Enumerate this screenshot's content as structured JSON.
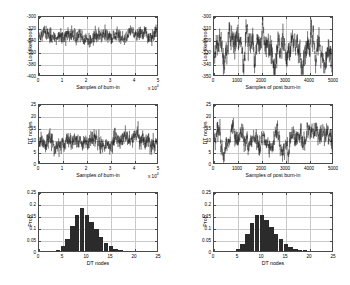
{
  "figure": {
    "background": "#ffffff",
    "axis_color": "#4a4a4a",
    "grid_color": "#c9c9c9",
    "trace_color": "#1a1a1a",
    "bar_color": "#2b2b2b"
  },
  "chart_data": [
    {
      "id": "burnin-loglik",
      "type": "line",
      "title": "",
      "xlabel": "Samples of burn-in",
      "ylabel": "Log likelihood",
      "xlim": [
        0,
        50000
      ],
      "ylim": [
        -400,
        -300
      ],
      "xticks": [
        0,
        10000,
        20000,
        30000,
        40000,
        50000
      ],
      "xticklabels": [
        "0",
        "1",
        "2",
        "3",
        "4",
        "5"
      ],
      "x_exponent": "x 10",
      "x_exponent_sup": "4",
      "yticks": [
        -400,
        -380,
        -360,
        -340,
        -320,
        -300
      ],
      "yticklabels": [
        "-400",
        "-380",
        "-360",
        "-340",
        "-320",
        "-300"
      ],
      "grid": true,
      "series_mean": -332,
      "series_spread": 9,
      "n_points": 900,
      "seed": 11
    },
    {
      "id": "postburnin-loglik",
      "type": "line",
      "title": "",
      "xlabel": "Samples of post burn-in",
      "ylabel": "Log likelihood",
      "xlim": [
        0,
        5000
      ],
      "ylim": [
        -350,
        -300
      ],
      "xticks": [
        0,
        1000,
        2000,
        3000,
        4000,
        5000
      ],
      "xticklabels": [
        "0",
        "1000",
        "2000",
        "3000",
        "4000",
        "5000"
      ],
      "x_exponent": "",
      "x_exponent_sup": "",
      "yticks": [
        -350,
        -340,
        -330,
        -320,
        -310,
        -300
      ],
      "yticklabels": [
        "-350",
        "-340",
        "-330",
        "-320",
        "-310",
        "-300"
      ],
      "grid": true,
      "series_mean": -327,
      "series_spread": 8,
      "n_points": 900,
      "seed": 23
    },
    {
      "id": "burnin-dtnodes",
      "type": "line",
      "title": "",
      "xlabel": "Samples of burn-in",
      "ylabel": "DT nodes",
      "xlim": [
        0,
        50000
      ],
      "ylim": [
        0,
        25
      ],
      "xticks": [
        0,
        10000,
        20000,
        30000,
        40000,
        50000
      ],
      "xticklabels": [
        "0",
        "1",
        "2",
        "3",
        "4",
        "5"
      ],
      "x_exponent": "x 10",
      "x_exponent_sup": "4",
      "yticks": [
        0,
        5,
        10,
        15,
        20,
        25
      ],
      "yticklabels": [
        "0",
        "5",
        "10",
        "15",
        "20",
        "25"
      ],
      "grid": true,
      "series_mean": 10,
      "series_spread": 2.6,
      "n_points": 900,
      "seed": 37
    },
    {
      "id": "postburnin-dtnodes",
      "type": "line",
      "title": "",
      "xlabel": "Samples of post burn-in",
      "ylabel": "DT nodes",
      "xlim": [
        0,
        5000
      ],
      "ylim": [
        0,
        25
      ],
      "xticks": [
        0,
        1000,
        2000,
        3000,
        4000,
        5000
      ],
      "xticklabels": [
        "0",
        "1000",
        "2000",
        "3000",
        "4000",
        "5000"
      ],
      "x_exponent": "",
      "x_exponent_sup": "",
      "yticks": [
        0,
        5,
        10,
        15,
        20,
        25
      ],
      "yticklabels": [
        "0",
        "5",
        "10",
        "15",
        "20",
        "25"
      ],
      "grid": true,
      "series_mean": 10.5,
      "series_spread": 2.6,
      "n_points": 900,
      "seed": 53
    },
    {
      "id": "burnin-hist",
      "type": "bar",
      "title": "",
      "xlabel": "DT nodes",
      "ylabel": "Prob",
      "xlim": [
        0,
        25
      ],
      "ylim": [
        0,
        0.25
      ],
      "xticks": [
        0,
        5,
        10,
        15,
        20,
        25
      ],
      "xticklabels": [
        "0",
        "5",
        "10",
        "15",
        "20",
        "25"
      ],
      "yticks": [
        0,
        0.05,
        0.1,
        0.15,
        0.2,
        0.25
      ],
      "yticklabels": [
        "0",
        "0.05",
        "0.1",
        "0.15",
        "0.2",
        "0.25"
      ],
      "grid": true,
      "categories": [
        3,
        4,
        5,
        6,
        7,
        8,
        9,
        10,
        11,
        12,
        13,
        14,
        15,
        16,
        17,
        18,
        19,
        20
      ],
      "values": [
        0.002,
        0.004,
        0.02,
        0.052,
        0.105,
        0.152,
        0.181,
        0.15,
        0.122,
        0.092,
        0.06,
        0.033,
        0.02,
        0.01,
        0.005,
        0.002,
        0.001,
        0.0
      ]
    },
    {
      "id": "postburnin-hist",
      "type": "bar",
      "title": "",
      "xlabel": "DT nodes",
      "ylabel": "Prob",
      "xlim": [
        0,
        25
      ],
      "ylim": [
        0,
        0.25
      ],
      "xticks": [
        0,
        5,
        10,
        15,
        20,
        25
      ],
      "xticklabels": [
        "0",
        "5",
        "10",
        "15",
        "20",
        "25"
      ],
      "yticks": [
        0,
        0.05,
        0.1,
        0.15,
        0.2,
        0.25
      ],
      "yticklabels": [
        "0",
        "0.05",
        "0.1",
        "0.15",
        "0.2",
        "0.25"
      ],
      "grid": true,
      "categories": [
        4,
        5,
        6,
        7,
        8,
        9,
        10,
        11,
        12,
        13,
        14,
        15,
        16,
        17,
        18,
        19,
        20,
        21
      ],
      "values": [
        0.002,
        0.008,
        0.03,
        0.07,
        0.118,
        0.148,
        0.15,
        0.128,
        0.102,
        0.072,
        0.048,
        0.028,
        0.015,
        0.008,
        0.005,
        0.003,
        0.002,
        0.001
      ]
    }
  ]
}
